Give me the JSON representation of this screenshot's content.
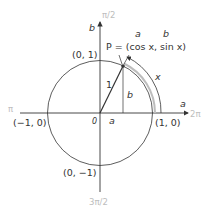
{
  "diagram": {
    "colors": {
      "stroke": "#333333",
      "arc_highlight": "#bdbdbd",
      "angle_labels": "#bdbdbd"
    },
    "labels": {
      "top_angle": "π/2",
      "bottom_angle": "3π/2",
      "left_angle": "π",
      "right_angle": "2π",
      "vertical_axis": "b",
      "horizontal_axis": "a",
      "point_top": "(0, 1)",
      "point_bottom": "(0, −1)",
      "point_left": "(−1, 0)",
      "point_right": "(1, 0)",
      "origin": "0",
      "radius": "1",
      "segment_b": "b",
      "segment_a": "a",
      "arc_length": "x",
      "point_P": "P = (cos x, sin x)",
      "annot_a": "a",
      "annot_b": "b"
    }
  }
}
